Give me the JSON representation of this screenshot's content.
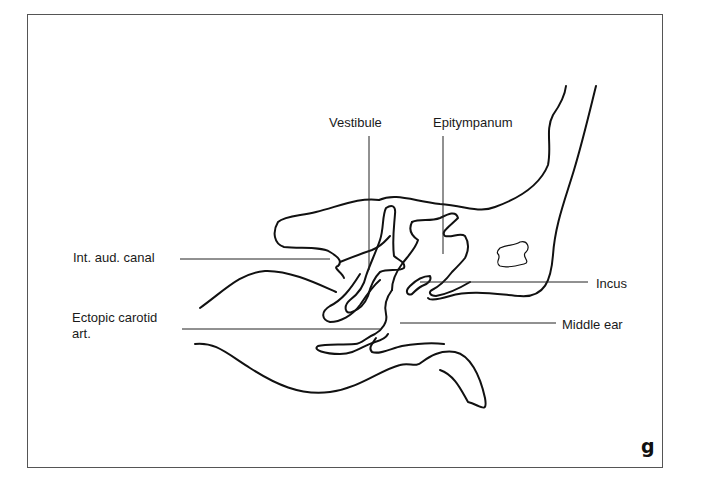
{
  "figure": {
    "panel_letter": "g",
    "labels": {
      "vestibule": "Vestibule",
      "epitympanum": "Epitympanum",
      "int_aud_canal": "Int. aud. canal",
      "ectopic_carotid_line1": "Ectopic carotid",
      "ectopic_carotid_line2": "art.",
      "incus": "Incus",
      "middle_ear": "Middle ear"
    },
    "colors": {
      "stroke": "#111111",
      "frame": "#555555",
      "background": "#ffffff"
    }
  }
}
